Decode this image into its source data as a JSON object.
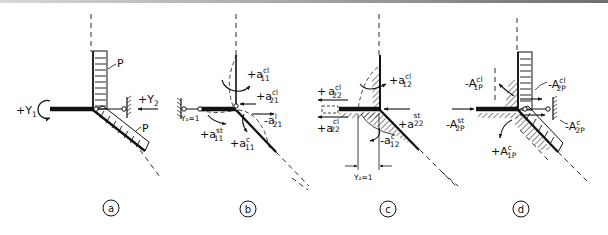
{
  "figure": {
    "panels": [
      {
        "id": "a",
        "label": "a",
        "annotations": {
          "load_top": "P",
          "load_diag": "P",
          "rotation": {
            "sign": "+",
            "sym": "Y",
            "sub": "1"
          },
          "translation": {
            "sign": "+",
            "sym": "Y",
            "sub": "2"
          }
        }
      },
      {
        "id": "b",
        "label": "b",
        "annotations": {
          "imposed": "Y₁=1",
          "a11cl": {
            "sign": "+",
            "sym": "a",
            "sub": "11",
            "sup": "cl"
          },
          "a21cl": {
            "sign": "+",
            "sym": "a",
            "sub": "21",
            "sup": "cl"
          },
          "a21l": {
            "sign": "-",
            "sym": "a",
            "sub": "21",
            "sup": "l"
          },
          "a11st": {
            "sign": "+",
            "sym": "a",
            "sub": "11",
            "sup": "st"
          },
          "a11c": {
            "sign": "+",
            "sym": "a",
            "sub": "11",
            "sup": "c"
          }
        }
      },
      {
        "id": "c",
        "label": "c",
        "annotations": {
          "imposed": "Y₂=1",
          "a22cl_top": {
            "sign": "+",
            "sym": "a",
            "sub": "22",
            "sup": "cl"
          },
          "a22cl_bot": {
            "sign": "+",
            "sym": "a",
            "sub": "22",
            "sup": "cl"
          },
          "a12cl": {
            "sign": "+",
            "sym": "a",
            "sub": "12",
            "sup": "cl"
          },
          "a22st": {
            "sign": "+",
            "sym": "a",
            "sub": "22",
            "sup": "st"
          },
          "a12c": {
            "sign": "-",
            "sym": "a",
            "sub": "12",
            "sup": "c"
          }
        }
      },
      {
        "id": "d",
        "label": "d",
        "annotations": {
          "A1Pcl": {
            "sign": "-",
            "sym": "A",
            "sub": "1P",
            "sup": "cl"
          },
          "A2Pcl": {
            "sign": "-",
            "sym": "A",
            "sub": "2P",
            "sup": "cl"
          },
          "A2Pst": {
            "sign": "-",
            "sym": "A",
            "sub": "2P",
            "sup": "st"
          },
          "A2Pc": {
            "sign": "-",
            "sym": "A",
            "sub": "2P",
            "sup": "c"
          },
          "A1Pc": {
            "sign": "+",
            "sym": "A",
            "sub": "1P",
            "sup": "c"
          }
        }
      }
    ]
  }
}
